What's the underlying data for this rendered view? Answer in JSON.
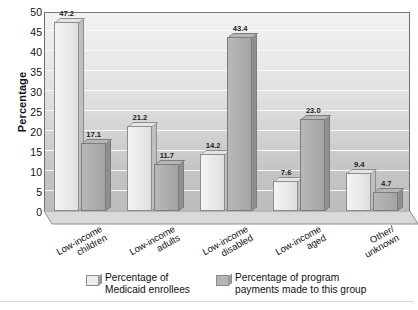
{
  "chart_data": {
    "type": "bar",
    "title": "",
    "xlabel": "",
    "ylabel": "Percentage",
    "ylim": [
      0,
      50
    ],
    "ytick_step": 5,
    "yticks": [
      "0",
      "5",
      "10",
      "15",
      "20",
      "25",
      "30",
      "35",
      "40",
      "45",
      "50"
    ],
    "grid": true,
    "legend_position": "bottom",
    "categories": [
      "Low-income children",
      "Low-income adults",
      "Low-income disabled",
      "Low-income aged",
      "Other/ unknown"
    ],
    "category_lines": [
      [
        "Low-income",
        "children"
      ],
      [
        "Low-income",
        "adults"
      ],
      [
        "Low-income",
        "disabled"
      ],
      [
        "Low-income",
        "aged"
      ],
      [
        "Other/",
        "unknown"
      ]
    ],
    "series": [
      {
        "name": "Percentage of Medicaid enrollees",
        "name_lines": [
          "Percentage of",
          "Medicaid enrollees"
        ],
        "color": "#ededed",
        "values": [
          47.2,
          21.2,
          14.2,
          7.6,
          9.4
        ],
        "labels": [
          "47.2",
          "21.2",
          "14.2",
          "7.6",
          "9.4"
        ]
      },
      {
        "name": "Percentage of program payments made to this group",
        "name_lines": [
          "Percentage of program",
          "payments made to this group"
        ],
        "color": "#b5b5b5",
        "values": [
          17.1,
          11.7,
          43.4,
          23.0,
          4.7
        ],
        "labels": [
          "17.1",
          "11.7",
          "43.4",
          "23.0",
          "4.7"
        ]
      }
    ]
  }
}
